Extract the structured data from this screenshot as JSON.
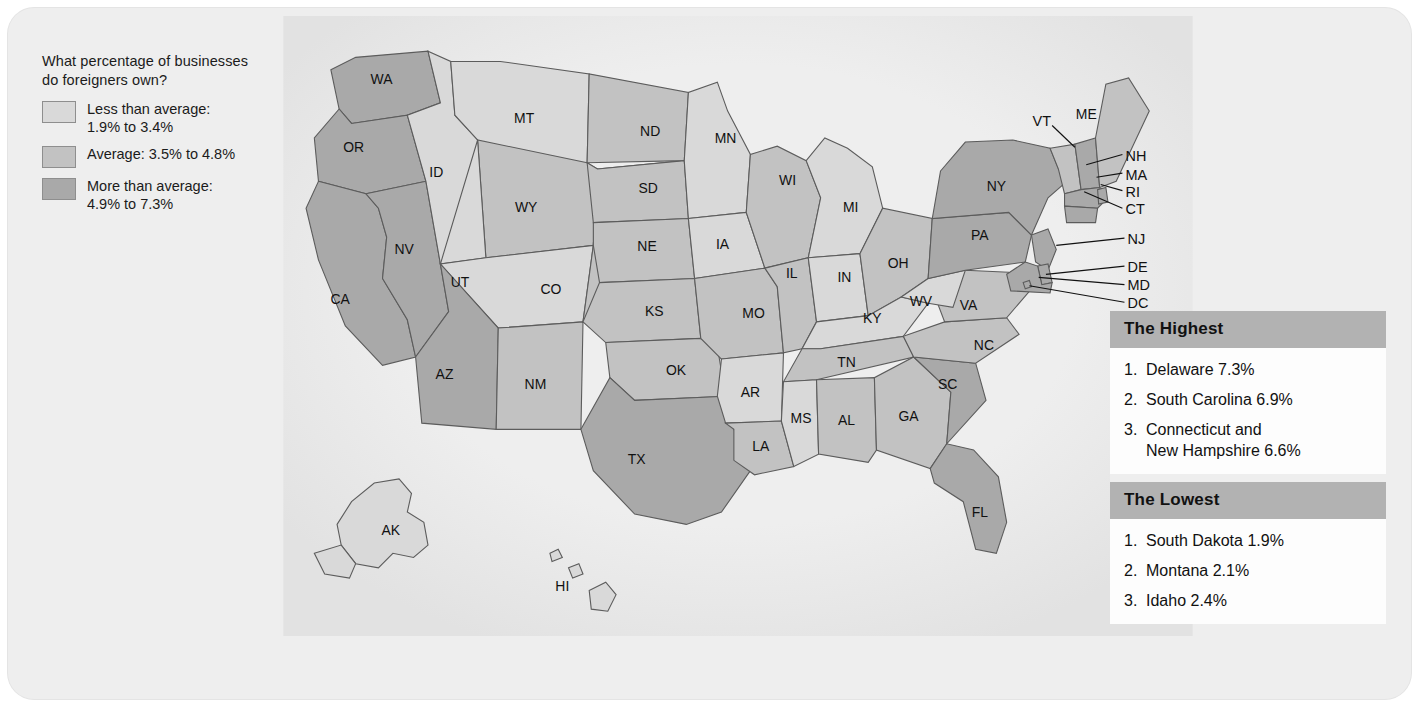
{
  "legend": {
    "question": "What percentage of businesses\ndo foreigners own?",
    "items": [
      {
        "label": "Less than average:\n1.9% to 3.4%",
        "color": "#d9d9d9",
        "tier": "low"
      },
      {
        "label": "Average: 3.5% to 4.8%",
        "color": "#c2c2c2",
        "tier": "mid"
      },
      {
        "label": "More than average:\n4.9% to 7.3%",
        "color": "#a9a9a9",
        "tier": "high"
      }
    ]
  },
  "cards": [
    {
      "title": "The Highest",
      "rows": [
        {
          "rank": "1.",
          "name": "Delaware 7.3%"
        },
        {
          "rank": "2.",
          "name": "South Carolina 6.9%"
        },
        {
          "rank": "3.",
          "name": "Connecticut and\nNew Hampshire 6.6%"
        }
      ]
    },
    {
      "title": "The Lowest",
      "rows": [
        {
          "rank": "1.",
          "name": "South Dakota 1.9%"
        },
        {
          "rank": "2.",
          "name": "Montana  2.1%"
        },
        {
          "rank": "3.",
          "name": "Idaho 2.4%"
        }
      ]
    }
  ],
  "chart_data": {
    "type": "map",
    "title": "What percentage of businesses do foreigners own?",
    "unit": "percent",
    "classes": [
      {
        "name": "Less than average",
        "range": "1.9% to 3.4%",
        "color": "#d9d9d9"
      },
      {
        "name": "Average",
        "range": "3.5% to 4.8%",
        "color": "#c2c2c2"
      },
      {
        "name": "More than average",
        "range": "4.9% to 7.3%",
        "color": "#a9a9a9"
      }
    ],
    "highest": [
      {
        "rank": 1,
        "state": "Delaware",
        "value": 7.3
      },
      {
        "rank": 2,
        "state": "South Carolina",
        "value": 6.9
      },
      {
        "rank": 3,
        "state": "Connecticut",
        "value": 6.6
      },
      {
        "rank": 3,
        "state": "New Hampshire",
        "value": 6.6
      }
    ],
    "lowest": [
      {
        "rank": 1,
        "state": "South Dakota",
        "value": 1.9
      },
      {
        "rank": 2,
        "state": "Montana",
        "value": 2.1
      },
      {
        "rank": 3,
        "state": "Idaho",
        "value": 2.4
      }
    ],
    "states": [
      {
        "code": "WA",
        "tier": "high"
      },
      {
        "code": "OR",
        "tier": "high"
      },
      {
        "code": "CA",
        "tier": "high"
      },
      {
        "code": "NV",
        "tier": "high"
      },
      {
        "code": "ID",
        "tier": "low"
      },
      {
        "code": "MT",
        "tier": "low"
      },
      {
        "code": "WY",
        "tier": "mid"
      },
      {
        "code": "UT",
        "tier": "low"
      },
      {
        "code": "AZ",
        "tier": "high"
      },
      {
        "code": "NM",
        "tier": "mid"
      },
      {
        "code": "CO",
        "tier": "mid"
      },
      {
        "code": "ND",
        "tier": "mid"
      },
      {
        "code": "SD",
        "tier": "mid"
      },
      {
        "code": "NE",
        "tier": "mid"
      },
      {
        "code": "KS",
        "tier": "mid"
      },
      {
        "code": "OK",
        "tier": "mid"
      },
      {
        "code": "TX",
        "tier": "high"
      },
      {
        "code": "MN",
        "tier": "low"
      },
      {
        "code": "IA",
        "tier": "low"
      },
      {
        "code": "MO",
        "tier": "mid"
      },
      {
        "code": "AR",
        "tier": "low"
      },
      {
        "code": "LA",
        "tier": "mid"
      },
      {
        "code": "WI",
        "tier": "mid"
      },
      {
        "code": "IL",
        "tier": "mid"
      },
      {
        "code": "MI",
        "tier": "low"
      },
      {
        "code": "IN",
        "tier": "low"
      },
      {
        "code": "OH",
        "tier": "mid"
      },
      {
        "code": "KY",
        "tier": "low"
      },
      {
        "code": "TN",
        "tier": "mid"
      },
      {
        "code": "MS",
        "tier": "low"
      },
      {
        "code": "AL",
        "tier": "mid"
      },
      {
        "code": "GA",
        "tier": "mid"
      },
      {
        "code": "FL",
        "tier": "high"
      },
      {
        "code": "SC",
        "tier": "high"
      },
      {
        "code": "NC",
        "tier": "mid"
      },
      {
        "code": "VA",
        "tier": "mid"
      },
      {
        "code": "WV",
        "tier": "low"
      },
      {
        "code": "PA",
        "tier": "high"
      },
      {
        "code": "NY",
        "tier": "high"
      },
      {
        "code": "VT",
        "tier": "mid"
      },
      {
        "code": "NH",
        "tier": "high"
      },
      {
        "code": "ME",
        "tier": "mid"
      },
      {
        "code": "MA",
        "tier": "high"
      },
      {
        "code": "RI",
        "tier": "high"
      },
      {
        "code": "CT",
        "tier": "high"
      },
      {
        "code": "NJ",
        "tier": "high"
      },
      {
        "code": "DE",
        "tier": "high"
      },
      {
        "code": "MD",
        "tier": "high"
      },
      {
        "code": "DC",
        "tier": "high"
      },
      {
        "code": "AK",
        "tier": "low"
      },
      {
        "code": "HI",
        "tier": "low"
      }
    ]
  },
  "map": {
    "inline_labels": [
      {
        "code": "WA",
        "x": 95,
        "y": 62
      },
      {
        "code": "OR",
        "x": 68,
        "y": 128
      },
      {
        "code": "CA",
        "x": 55,
        "y": 275
      },
      {
        "code": "NV",
        "x": 117,
        "y": 227
      },
      {
        "code": "ID",
        "x": 148,
        "y": 152
      },
      {
        "code": "MT",
        "x": 233,
        "y": 100
      },
      {
        "code": "WY",
        "x": 235,
        "y": 186
      },
      {
        "code": "UT",
        "x": 171,
        "y": 259
      },
      {
        "code": "CO",
        "x": 259,
        "y": 265
      },
      {
        "code": "AZ",
        "x": 156,
        "y": 348
      },
      {
        "code": "NM",
        "x": 244,
        "y": 357
      },
      {
        "code": "ND",
        "x": 355,
        "y": 113
      },
      {
        "code": "SD",
        "x": 353,
        "y": 168
      },
      {
        "code": "NE",
        "x": 352,
        "y": 224
      },
      {
        "code": "KS",
        "x": 359,
        "y": 287
      },
      {
        "code": "OK",
        "x": 380,
        "y": 344
      },
      {
        "code": "TX",
        "x": 342,
        "y": 430
      },
      {
        "code": "MN",
        "x": 428,
        "y": 119
      },
      {
        "code": "IA",
        "x": 425,
        "y": 222
      },
      {
        "code": "MO",
        "x": 455,
        "y": 289
      },
      {
        "code": "AR",
        "x": 452,
        "y": 365
      },
      {
        "code": "LA",
        "x": 462,
        "y": 417
      },
      {
        "code": "WI",
        "x": 488,
        "y": 160
      },
      {
        "code": "IL",
        "x": 492,
        "y": 250
      },
      {
        "code": "MI",
        "x": 549,
        "y": 186
      },
      {
        "code": "IN",
        "x": 543,
        "y": 254
      },
      {
        "code": "OH",
        "x": 595,
        "y": 240
      },
      {
        "code": "KY",
        "x": 570,
        "y": 294
      },
      {
        "code": "TN",
        "x": 545,
        "y": 336
      },
      {
        "code": "MS",
        "x": 501,
        "y": 390
      },
      {
        "code": "AL",
        "x": 545,
        "y": 392
      },
      {
        "code": "GA",
        "x": 605,
        "y": 388
      },
      {
        "code": "FL",
        "x": 674,
        "y": 481
      },
      {
        "code": "SC",
        "x": 643,
        "y": 357
      },
      {
        "code": "NC",
        "x": 678,
        "y": 320
      },
      {
        "code": "VA",
        "x": 663,
        "y": 281
      },
      {
        "code": "WV",
        "x": 617,
        "y": 277
      },
      {
        "code": "PA",
        "x": 674,
        "y": 213
      },
      {
        "code": "NY",
        "x": 690,
        "y": 166
      },
      {
        "code": "ME",
        "x": 777,
        "y": 96
      },
      {
        "code": "AK",
        "x": 104,
        "y": 499
      },
      {
        "code": "HI",
        "x": 270,
        "y": 553
      }
    ],
    "callout_labels": [
      {
        "code": "VT",
        "tx": 725,
        "ty": 103,
        "x1": 744,
        "y1": 106,
        "x2": 766,
        "y2": 127
      },
      {
        "code": "NH",
        "tx": 815,
        "ty": 137,
        "x1": 812,
        "y1": 134,
        "x2": 777,
        "y2": 144
      },
      {
        "code": "MA",
        "tx": 815,
        "ty": 155,
        "x1": 812,
        "y1": 152,
        "x2": 787,
        "y2": 156
      },
      {
        "code": "RI",
        "tx": 815,
        "ty": 171,
        "x1": 812,
        "y1": 169,
        "x2": 791,
        "y2": 163
      },
      {
        "code": "CT",
        "tx": 815,
        "ty": 188,
        "x1": 812,
        "y1": 186,
        "x2": 775,
        "y2": 170
      },
      {
        "code": "NJ",
        "tx": 817,
        "ty": 217,
        "x1": 814,
        "y1": 215,
        "x2": 748,
        "y2": 222
      },
      {
        "code": "DE",
        "tx": 817,
        "ty": 244,
        "x1": 814,
        "y1": 242,
        "x2": 738,
        "y2": 250
      },
      {
        "code": "MD",
        "tx": 817,
        "ty": 261,
        "x1": 814,
        "y1": 260,
        "x2": 731,
        "y2": 253
      },
      {
        "code": "DC",
        "tx": 817,
        "ty": 279,
        "x1": 814,
        "y1": 277,
        "x2": 722,
        "y2": 261
      }
    ]
  }
}
